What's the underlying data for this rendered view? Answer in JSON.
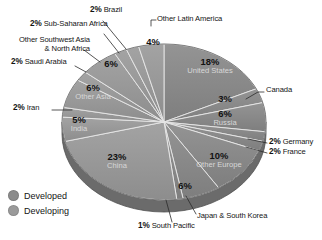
{
  "chart_data": {
    "type": "pie",
    "title": "",
    "subtitle": "",
    "xlabel": "",
    "ylabel": "",
    "grid": false,
    "legend_position": "bottom-left",
    "units": "percent",
    "start_angle_deg": 0,
    "direction": "clockwise",
    "categories": [
      "United States",
      "Canada",
      "Russia",
      "Germany",
      "France",
      "Other Europe",
      "Japan & South Korea",
      "South Pacific",
      "China",
      "India",
      "Iran",
      "Other Asia",
      "Saudi Arabia",
      "Other Southwest Asia & North Africa",
      "Sub-Saharan Africa",
      "Brazil",
      "Other Latin America"
    ],
    "values": [
      18,
      3,
      6,
      2,
      2,
      10,
      6,
      1,
      23,
      5,
      2,
      6,
      2,
      6,
      2,
      2,
      4
    ],
    "slices": [
      {
        "label": "United States",
        "value": 18,
        "pct_text": "18%",
        "group": "Developed",
        "color": "#8b8b8b",
        "label_placement": "inside"
      },
      {
        "label": "Canada",
        "value": 3,
        "pct_text": "3%",
        "group": "Developed",
        "color": "#8b8b8b",
        "label_placement": "callout"
      },
      {
        "label": "Russia",
        "value": 6,
        "pct_text": "6%",
        "group": "Developed",
        "color": "#8b8b8b",
        "label_placement": "inside"
      },
      {
        "label": "Germany",
        "value": 2,
        "pct_text": "2%",
        "group": "Developed",
        "color": "#8b8b8b",
        "label_placement": "callout"
      },
      {
        "label": "France",
        "value": 2,
        "pct_text": "2%",
        "group": "Developed",
        "color": "#8b8b8b",
        "label_placement": "callout"
      },
      {
        "label": "Other Europe",
        "value": 10,
        "pct_text": "10%",
        "group": "Developed",
        "color": "#8b8b8b",
        "label_placement": "inside"
      },
      {
        "label": "Japan & South Korea",
        "value": 6,
        "pct_text": "6%",
        "group": "Developed",
        "color": "#8b8b8b",
        "label_placement": "callout"
      },
      {
        "label": "South Pacific",
        "value": 1,
        "pct_text": "1%",
        "group": "Developed",
        "color": "#8b8b8b",
        "label_placement": "callout"
      },
      {
        "label": "China",
        "value": 23,
        "pct_text": "23%",
        "group": "Developing",
        "color": "#9a9a9a",
        "label_placement": "inside"
      },
      {
        "label": "India",
        "value": 5,
        "pct_text": "5%",
        "group": "Developing",
        "color": "#9a9a9a",
        "label_placement": "inside"
      },
      {
        "label": "Iran",
        "value": 2,
        "pct_text": "2%",
        "group": "Developing",
        "color": "#9a9a9a",
        "label_placement": "callout"
      },
      {
        "label": "Other Asia",
        "value": 6,
        "pct_text": "6%",
        "group": "Developing",
        "color": "#9a9a9a",
        "label_placement": "inside"
      },
      {
        "label": "Saudi Arabia",
        "value": 2,
        "pct_text": "2%",
        "group": "Developing",
        "color": "#9a9a9a",
        "label_placement": "callout"
      },
      {
        "label": "Other Southwest Asia & North Africa",
        "value": 6,
        "pct_text": "6%",
        "group": "Developing",
        "color": "#9a9a9a",
        "label_placement": "callout"
      },
      {
        "label": "Sub-Saharan Africa",
        "value": 2,
        "pct_text": "2%",
        "group": "Developing",
        "color": "#9a9a9a",
        "label_placement": "callout"
      },
      {
        "label": "Brazil",
        "value": 2,
        "pct_text": "2%",
        "group": "Developing",
        "color": "#9a9a9a",
        "label_placement": "callout"
      },
      {
        "label": "Other Latin America",
        "value": 4,
        "pct_text": "4%",
        "group": "Developing",
        "color": "#9a9a9a",
        "label_placement": "callout"
      }
    ],
    "legend": [
      {
        "label": "Developed",
        "color": "#8b8b8b"
      },
      {
        "label": "Developing",
        "color": "#9a9a9a"
      }
    ]
  },
  "labels": {
    "brazil_pct": "2%",
    "brazil_name": "Brazil",
    "subsaharan_pct": "2%",
    "subsaharan_name": "Sub-Saharan Africa",
    "swasia_line1": "Other Southwest Asia",
    "swasia_line2": "& North Africa",
    "saudi_pct": "2%",
    "saudi_name": "Saudi Arabia",
    "iran_pct": "2%",
    "iran_name": "Iran",
    "other_latin_america": "Other Latin America",
    "canada_name": "Canada",
    "germany_pct": "2%",
    "germany_name": "Germany",
    "france_pct": "2%",
    "france_name": "France",
    "japan_korea_name": "Japan & South Korea",
    "south_pacific_pct": "1%",
    "south_pacific_name": "South Pacific",
    "usa_pct": "18%",
    "usa_name": "United States",
    "canada_pct": "3%",
    "russia_pct": "6%",
    "russia_name": "Russia",
    "other_europe_pct": "10%",
    "other_europe_name": "Other Europe",
    "japan_korea_pct": "6%",
    "china_pct": "23%",
    "china_name": "China",
    "india_pct": "5%",
    "india_name": "India",
    "other_asia_pct": "6%",
    "other_asia_name": "Other Asia",
    "swasia_pct": "6%",
    "other_latin_pct": "4%"
  },
  "legend": {
    "developed": "Developed",
    "developing": "Developing",
    "developed_color": "#8b8b8b",
    "developing_color": "#9a9a9a"
  }
}
